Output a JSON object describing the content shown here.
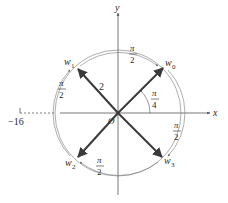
{
  "diagram": {
    "type": "complex-plane-roots",
    "axes": {
      "x_label": "x",
      "y_label": "y",
      "origin_label": "O"
    },
    "circle": {
      "radius_label": "2"
    },
    "real_point": {
      "label": "−16",
      "note": "label as printed in image; drawn schematically (not to scale) via dashed line"
    },
    "angle_from_x_axis": {
      "num": "π",
      "den": "4"
    },
    "vectors": [
      {
        "name": "w",
        "sub": "0"
      },
      {
        "name": "w",
        "sub": "1"
      },
      {
        "name": "w",
        "sub": "2"
      },
      {
        "name": "w",
        "sub": "3"
      }
    ],
    "arc_angles": [
      {
        "num": "π",
        "den": "2"
      },
      {
        "num": "π",
        "den": "2"
      },
      {
        "num": "π",
        "den": "2"
      },
      {
        "num": "π",
        "den": "2"
      }
    ],
    "colors": {
      "vector": "#3a3a3a",
      "axis": "#555555",
      "circle": "#777777",
      "text": "#2a2a2a"
    }
  }
}
